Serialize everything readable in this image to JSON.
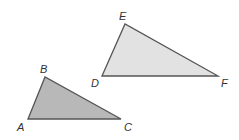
{
  "diagram": {
    "triangles": [
      {
        "name": "ABC",
        "fill": "#b8b8b8",
        "stroke": "#555555",
        "vertices": [
          {
            "label": "A",
            "x": 28,
            "y": 119,
            "lx": 17,
            "ly": 131
          },
          {
            "label": "B",
            "x": 45,
            "y": 77,
            "lx": 40,
            "ly": 73
          },
          {
            "label": "C",
            "x": 121,
            "y": 119,
            "lx": 124,
            "ly": 131
          }
        ]
      },
      {
        "name": "DEF",
        "fill": "#e2e2e2",
        "stroke": "#555555",
        "vertices": [
          {
            "label": "D",
            "x": 102,
            "y": 76,
            "lx": 91,
            "ly": 87
          },
          {
            "label": "E",
            "x": 125,
            "y": 24,
            "lx": 119,
            "ly": 20
          },
          {
            "label": "F",
            "x": 218,
            "y": 76,
            "lx": 221,
            "ly": 87
          }
        ]
      }
    ]
  }
}
